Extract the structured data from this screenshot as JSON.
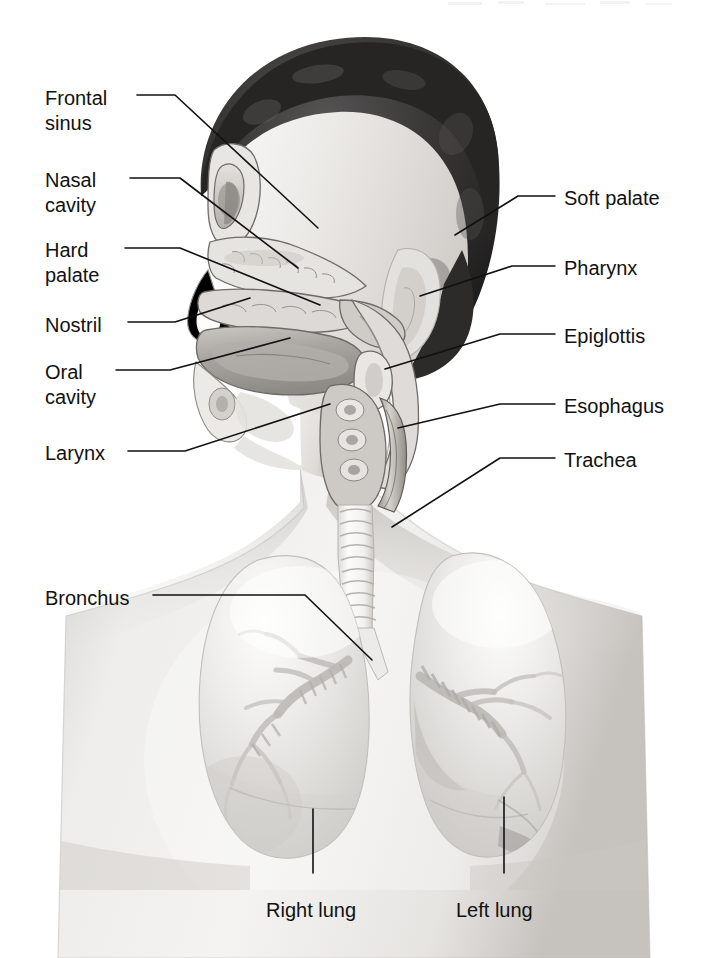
{
  "figure": {
    "background_color": "#ffffff",
    "line_color": "#111111",
    "width": 708,
    "height": 958
  },
  "labels_left": [
    {
      "id": "frontal-sinus",
      "text": "Frontal\nsinus",
      "x": 45,
      "y": 86
    },
    {
      "id": "nasal-cavity",
      "text": "Nasal\ncavity",
      "x": 45,
      "y": 168
    },
    {
      "id": "hard-palate",
      "text": "Hard\npalate",
      "x": 45,
      "y": 238
    },
    {
      "id": "nostril",
      "text": "Nostril",
      "x": 45,
      "y": 313
    },
    {
      "id": "oral-cavity",
      "text": "Oral\ncavity",
      "x": 45,
      "y": 360
    },
    {
      "id": "larynx",
      "text": "Larynx",
      "x": 45,
      "y": 441
    },
    {
      "id": "bronchus",
      "text": "Bronchus",
      "x": 45,
      "y": 586
    }
  ],
  "labels_right": [
    {
      "id": "soft-palate",
      "text": "Soft palate",
      "x": 564,
      "y": 186
    },
    {
      "id": "pharynx",
      "text": "Pharynx",
      "x": 564,
      "y": 256
    },
    {
      "id": "epiglottis",
      "text": "Epiglottis",
      "x": 564,
      "y": 324
    },
    {
      "id": "esophagus",
      "text": "Esophagus",
      "x": 564,
      "y": 394
    },
    {
      "id": "trachea",
      "text": "Trachea",
      "x": 564,
      "y": 448
    }
  ],
  "labels_bottom": [
    {
      "id": "right-lung",
      "text": "Right lung",
      "x": 266,
      "y": 898
    },
    {
      "id": "left-lung",
      "text": "Left lung",
      "x": 456,
      "y": 898
    }
  ],
  "leaders": [
    {
      "id": "leader-frontal-sinus",
      "points": "137,95 175,95 318,228"
    },
    {
      "id": "leader-nasal-cavity",
      "points": "130,178 180,178 298,268"
    },
    {
      "id": "leader-hard-palate",
      "points": "125,248 180,248 320,305"
    },
    {
      "id": "leader-nostril",
      "points": "128,322 175,322 250,298"
    },
    {
      "id": "leader-oral-cavity",
      "points": "116,370 170,370 290,338"
    },
    {
      "id": "leader-larynx",
      "points": "128,451 185,451 330,404"
    },
    {
      "id": "leader-bronchus",
      "points": "153,595 305,595 372,660"
    },
    {
      "id": "leader-soft-palate",
      "points": "555,196 518,196 455,235"
    },
    {
      "id": "leader-pharynx",
      "points": "555,266 512,266 420,296"
    },
    {
      "id": "leader-epiglottis",
      "points": "555,334 500,334 385,369"
    },
    {
      "id": "leader-esophagus",
      "points": "555,404 500,404 398,428"
    },
    {
      "id": "leader-trachea",
      "points": "555,458 500,458 392,527"
    },
    {
      "id": "leader-right-lung",
      "points": "313,809 313,873"
    },
    {
      "id": "leader-left-lung",
      "points": "504,797 504,873"
    }
  ],
  "anatomy_parts": [
    "hair",
    "forehead",
    "frontal sinus",
    "nasal cavity",
    "hard palate",
    "soft palate",
    "nostril",
    "oral cavity",
    "tongue",
    "pharynx",
    "epiglottis",
    "larynx",
    "esophagus",
    "trachea",
    "left bronchus",
    "right bronchus",
    "right lung",
    "left lung",
    "ear",
    "neck",
    "shoulders"
  ],
  "palette": {
    "ink": "#111111",
    "hair_dark": "#2b2b2b",
    "skin_light": "#f0efed",
    "skin_mid": "#d9d7d4",
    "skin_shadow": "#b9b6b2",
    "tissue_mid": "#c3c0bc",
    "tissue_dark": "#9c9893",
    "lung_fill": "#e6e5e2",
    "lung_edge": "#c9c7c3",
    "trachea_light": "#f6f5f3"
  }
}
